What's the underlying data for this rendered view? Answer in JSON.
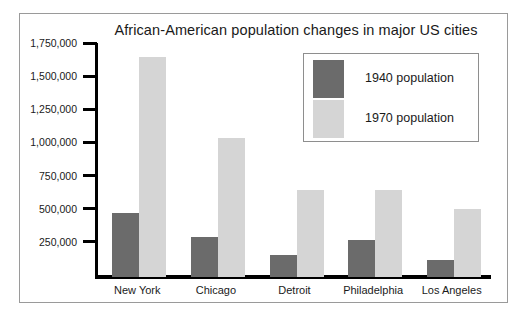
{
  "chart_data": {
    "type": "bar",
    "title": "African-American population changes in major US cities",
    "xlabel": "",
    "ylabel": "",
    "categories": [
      "New York",
      "Chicago",
      "Detroit",
      "Philadelphia",
      "Los Angeles"
    ],
    "series": [
      {
        "name": "1940 population",
        "color": "#6b6b6b",
        "values": [
          480000,
          300000,
          165000,
          280000,
          125000
        ]
      },
      {
        "name": "1970 population",
        "color": "#d5d5d5",
        "values": [
          1660000,
          1050000,
          660000,
          655000,
          510000
        ]
      }
    ],
    "ylim": [
      0,
      1750000
    ],
    "ytick_values": [
      250000,
      500000,
      750000,
      1000000,
      1250000,
      1500000,
      1750000
    ],
    "ytick_labels": [
      "250,000",
      "500,000",
      "750,000",
      "1,000,000",
      "1,250,000",
      "1,500,000",
      "1,750,000"
    ],
    "grid": false,
    "legend_position": "upper right",
    "legend_entries": [
      "1940 population",
      "1970 population"
    ]
  },
  "colors": {
    "series_1940": "#6b6b6b",
    "series_1970": "#d5d5d5",
    "axis": "#000000",
    "frame_border": "#9a9a9a",
    "legend_border": "#8e8e8e",
    "text": "#1a1a1a",
    "background": "#ffffff"
  }
}
